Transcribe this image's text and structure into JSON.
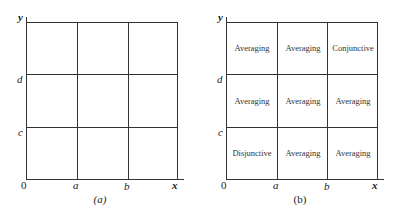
{
  "panels": [
    {
      "id": "a",
      "caption": "(a)",
      "axes": {
        "y_label": "y",
        "x_label": "x",
        "origin": "0"
      },
      "x_ticks": [
        "a",
        "b"
      ],
      "y_ticks": [
        "c",
        "d"
      ],
      "cells": []
    },
    {
      "id": "b",
      "caption": "(b)",
      "axes": {
        "y_label": "y",
        "x_label": "x",
        "origin": "0"
      },
      "x_ticks": [
        "a",
        "b"
      ],
      "y_ticks": [
        "c",
        "d"
      ],
      "cells": [
        [
          "Averaging",
          "Averaging",
          "Conjunctive"
        ],
        [
          "Averaging",
          "Averaging",
          "Averaging"
        ],
        [
          "Disjunctive",
          "Averaging",
          "Averaging"
        ]
      ]
    }
  ]
}
